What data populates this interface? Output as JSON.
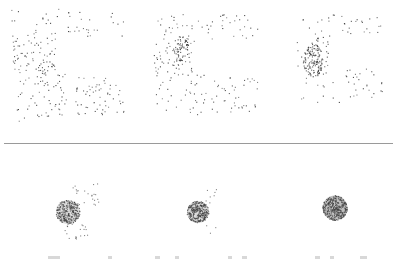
{
  "figure": {
    "point_color": "#3a3a3a",
    "sphere_shade": "#555555",
    "divider_color": "#9a9a9a",
    "rows": [
      {
        "name": "top-row",
        "panels": [
          {
            "name": "stage-1",
            "x": 5,
            "y": 2,
            "w": 125,
            "h": 125,
            "mode": "scatter",
            "seed": 11,
            "n": 230,
            "cluster": {
              "cx": 0.33,
              "cy": 0.55,
              "r": 0.08,
              "n": 20
            }
          },
          {
            "name": "stage-2",
            "x": 148,
            "y": 8,
            "w": 115,
            "h": 115,
            "mode": "scatter",
            "seed": 23,
            "n": 190,
            "cluster": {
              "cx": 0.28,
              "cy": 0.35,
              "r": 0.09,
              "n": 60
            }
          },
          {
            "name": "stage-3",
            "x": 292,
            "y": 8,
            "w": 95,
            "h": 100,
            "mode": "scatter",
            "seed": 37,
            "n": 110,
            "cluster": {
              "cx": 0.22,
              "cy": 0.52,
              "r": 0.13,
              "n": 130
            }
          }
        ]
      },
      {
        "name": "bottom-row",
        "panels": [
          {
            "name": "stage-4",
            "x": 40,
            "y": 172,
            "w": 60,
            "h": 70,
            "mode": "sphere-scatter",
            "seed": 41,
            "sphere": {
              "cx": 28,
              "cy": 40,
              "r": 12,
              "n": 260
            },
            "stray": 45
          },
          {
            "name": "stage-5",
            "x": 180,
            "y": 185,
            "w": 40,
            "h": 50,
            "mode": "sphere-scatter",
            "seed": 53,
            "sphere": {
              "cx": 18,
              "cy": 27,
              "r": 11,
              "n": 280
            },
            "stray": 14
          },
          {
            "name": "stage-6",
            "x": 320,
            "y": 193,
            "w": 30,
            "h": 30,
            "mode": "sphere",
            "seed": 67,
            "sphere": {
              "cx": 15,
              "cy": 15,
              "r": 12.5,
              "n": 320
            },
            "stray": 0
          }
        ]
      }
    ],
    "caption_marks": [
      {
        "x": 48,
        "w": 12
      },
      {
        "x": 108,
        "w": 4
      },
      {
        "x": 155,
        "w": 5
      },
      {
        "x": 175,
        "w": 4
      },
      {
        "x": 228,
        "w": 4
      },
      {
        "x": 242,
        "w": 5
      },
      {
        "x": 315,
        "w": 5
      },
      {
        "x": 330,
        "w": 4
      },
      {
        "x": 360,
        "w": 7
      }
    ]
  }
}
